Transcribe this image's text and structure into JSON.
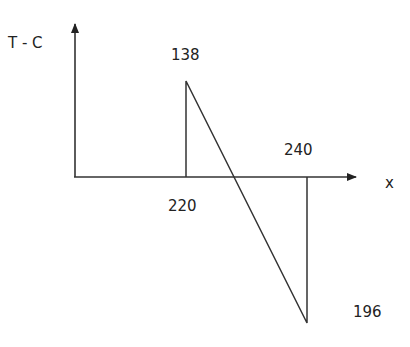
{
  "diagram": {
    "type": "shear-force-diagram",
    "y_axis_label": "T - C",
    "x_axis_label": "x",
    "labels": {
      "peak_value": "138",
      "start_position": "220",
      "end_position": "240",
      "min_value": "196"
    },
    "points": [
      {
        "x": 220,
        "value": 0
      },
      {
        "x": 220,
        "value": 138
      },
      {
        "x": 240,
        "value": -196
      },
      {
        "x": 240,
        "value": 0
      }
    ],
    "colors": {
      "line": "#333333",
      "background": "#ffffff"
    }
  }
}
